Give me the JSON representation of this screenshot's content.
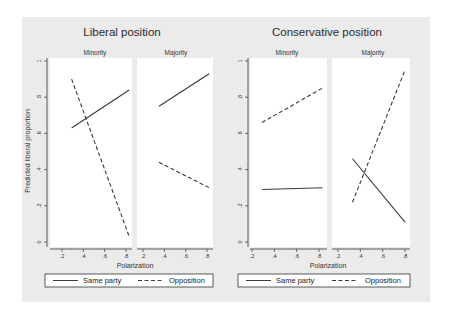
{
  "chart_data": [
    {
      "type": "line",
      "title": "Liberal position",
      "xlabel": "Polarization",
      "ylabel": "Predicted liberal proportion",
      "ylim": [
        0,
        1
      ],
      "yticks": [
        "0",
        ".2",
        ".4",
        ".6",
        ".8",
        "1"
      ],
      "xticks": [
        ".2",
        ".4",
        ".6",
        ".8"
      ],
      "xlim": [
        0.2,
        0.8
      ],
      "grid": false,
      "legend": {
        "position": "bottom",
        "entries": [
          "Same party",
          "Opposition"
        ]
      },
      "panels": [
        {
          "label": "Minority",
          "series": [
            {
              "name": "Same party",
              "style": "solid",
              "x": [
                0.29,
                0.83
              ],
              "y": [
                0.63,
                0.84
              ]
            },
            {
              "name": "Opposition",
              "style": "dashed",
              "x": [
                0.29,
                0.83
              ],
              "y": [
                0.9,
                0.03
              ]
            }
          ]
        },
        {
          "label": "Majority",
          "series": [
            {
              "name": "Same party",
              "style": "solid",
              "x": [
                0.35,
                0.82
              ],
              "y": [
                0.75,
                0.93
              ]
            },
            {
              "name": "Opposition",
              "style": "dashed",
              "x": [
                0.35,
                0.82
              ],
              "y": [
                0.44,
                0.3
              ]
            }
          ]
        }
      ]
    },
    {
      "type": "line",
      "title": "Conservative position",
      "xlabel": "Polarization",
      "ylabel": "",
      "ylim": [
        0,
        1
      ],
      "yticks": [
        "0",
        ".2",
        ".4",
        ".6",
        ".8",
        "1"
      ],
      "xticks": [
        ".2",
        ".4",
        ".6",
        ".8"
      ],
      "xlim": [
        0.2,
        0.8
      ],
      "grid": false,
      "legend": {
        "position": "bottom",
        "entries": [
          "Same party",
          "Opposition"
        ]
      },
      "panels": [
        {
          "label": "Minority",
          "series": [
            {
              "name": "Same party",
              "style": "solid",
              "x": [
                0.29,
                0.83
              ],
              "y": [
                0.29,
                0.3
              ]
            },
            {
              "name": "Opposition",
              "style": "dashed",
              "x": [
                0.29,
                0.83
              ],
              "y": [
                0.66,
                0.85
              ]
            }
          ]
        },
        {
          "label": "Majority",
          "series": [
            {
              "name": "Same party",
              "style": "solid",
              "x": [
                0.33,
                0.8
              ],
              "y": [
                0.46,
                0.11
              ]
            },
            {
              "name": "Opposition",
              "style": "dashed",
              "x": [
                0.33,
                0.8
              ],
              "y": [
                0.22,
                0.95
              ]
            }
          ]
        }
      ]
    }
  ],
  "colors": {
    "figure_bg": "#ebebeb",
    "plot_bg": "#ffffff",
    "line": "#3a3a3a"
  }
}
